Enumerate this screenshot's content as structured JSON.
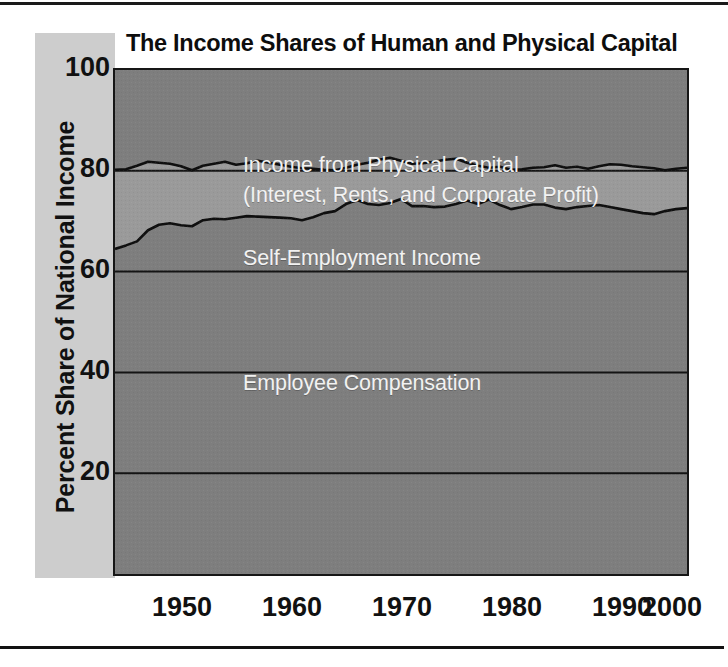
{
  "figure": {
    "title": "The Income Shares of Human and Physical Capital",
    "ylabel": "Percent Share of National Income",
    "band_labels": {
      "physical_line1": "Income from Physical Capital",
      "physical_line2": "(Interest, Rents, and Corporate Profit)",
      "self_employment": "Self-Employment Income",
      "employee": "Employee Compensation"
    },
    "colors": {
      "physical_capital_fill": "#7e7e7e",
      "self_employment_fill": "#9a9a9a",
      "employee_fill": "#7e7e7e",
      "axis_band": "#cdcdcd",
      "frame": "#161616",
      "label_text": "#f2f2f2",
      "tick_text": "#111111"
    }
  },
  "chart_data": {
    "type": "area",
    "title": "The Income Shares of Human and Physical Capital",
    "xlabel": "",
    "ylabel": "Percent Share of National Income",
    "xlim": [
      1948,
      2000
    ],
    "ylim": [
      0,
      100
    ],
    "grid": true,
    "gridlines_y": [
      20,
      40,
      60,
      80
    ],
    "yticks": [
      20,
      40,
      60,
      80,
      100
    ],
    "ytick_labels": [
      "20",
      "40",
      "60",
      "80",
      "100"
    ],
    "xticks": [
      1950,
      1960,
      1970,
      1980,
      1990,
      2000
    ],
    "xtick_labels": [
      "1950",
      "1960",
      "1970",
      "1980",
      "1990",
      "2000"
    ],
    "stacked": true,
    "legend_position": "in-plot annotations",
    "x": [
      1948,
      1949,
      1950,
      1951,
      1952,
      1953,
      1954,
      1955,
      1956,
      1957,
      1958,
      1959,
      1960,
      1961,
      1962,
      1963,
      1964,
      1965,
      1966,
      1967,
      1968,
      1969,
      1970,
      1971,
      1972,
      1973,
      1974,
      1975,
      1976,
      1977,
      1978,
      1979,
      1980,
      1981,
      1982,
      1983,
      1984,
      1985,
      1986,
      1987,
      1988,
      1989,
      1990,
      1991,
      1992,
      1993,
      1994,
      1995,
      1996,
      1997,
      1998,
      1999,
      2000
    ],
    "series": [
      {
        "name": "Employee Compensation",
        "note": "cumulative boundary = employee compensation share",
        "values": [
          64.5,
          65.2,
          66.0,
          68.2,
          69.3,
          69.6,
          69.2,
          69.0,
          70.2,
          70.5,
          70.4,
          70.7,
          71.0,
          70.9,
          70.8,
          70.7,
          70.6,
          70.2,
          70.8,
          71.6,
          72.0,
          73.4,
          74.2,
          73.4,
          73.2,
          73.6,
          74.4,
          73.0,
          73.0,
          72.8,
          72.9,
          73.4,
          74.1,
          73.4,
          74.3,
          73.2,
          72.4,
          72.8,
          73.3,
          73.3,
          72.7,
          72.4,
          72.8,
          73.0,
          73.2,
          72.8,
          72.4,
          72.0,
          71.6,
          71.4,
          72.0,
          72.4,
          72.6
        ]
      },
      {
        "name": "Self-Employment Income",
        "note": "cumulative boundary = employee compensation + self-employment",
        "cumulative_values": [
          80.2,
          80.3,
          81.0,
          81.8,
          81.6,
          81.4,
          80.9,
          80.1,
          81.0,
          81.4,
          81.8,
          81.2,
          81.5,
          82.0,
          81.6,
          81.2,
          80.8,
          80.5,
          80.4,
          80.2,
          80.1,
          80.6,
          81.2,
          81.6,
          82.2,
          82.6,
          82.0,
          81.4,
          81.5,
          81.8,
          82.2,
          82.4,
          81.6,
          81.0,
          80.6,
          80.8,
          80.2,
          80.3,
          80.6,
          80.7,
          81.1,
          80.6,
          80.8,
          80.4,
          80.9,
          81.3,
          81.2,
          80.9,
          80.7,
          80.5,
          80.1,
          80.4,
          80.6
        ]
      },
      {
        "name": "Income from Physical Capital (Interest, Rents, and Corporate Profit)",
        "note": "remainder up to 100 percent",
        "cumulative_values": [
          100,
          100,
          100,
          100,
          100,
          100,
          100,
          100,
          100,
          100,
          100,
          100,
          100,
          100,
          100,
          100,
          100,
          100,
          100,
          100,
          100,
          100,
          100,
          100,
          100,
          100,
          100,
          100,
          100,
          100,
          100,
          100,
          100,
          100,
          100,
          100,
          100,
          100,
          100,
          100,
          100,
          100,
          100,
          100,
          100,
          100,
          100,
          100,
          100,
          100,
          100,
          100,
          100
        ]
      }
    ]
  }
}
